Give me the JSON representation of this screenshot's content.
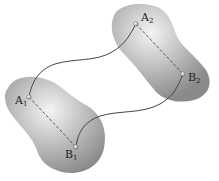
{
  "diagram": {
    "bodies": [
      {
        "id": "body-1",
        "position": "lower-left"
      },
      {
        "id": "body-2",
        "position": "upper-right"
      }
    ],
    "points": [
      {
        "id": "A1",
        "base": "A",
        "sub": "1",
        "x": 29,
        "y": 97
      },
      {
        "id": "B1",
        "base": "B",
        "sub": "1",
        "x": 76,
        "y": 147
      },
      {
        "id": "A2",
        "base": "A",
        "sub": "2",
        "x": 136,
        "y": 24
      },
      {
        "id": "B2",
        "base": "B",
        "sub": "2",
        "x": 183,
        "y": 74
      }
    ],
    "colors": {
      "body_fill": "#9a9a9a",
      "body_highlight": "#f2f2f2",
      "path_stroke": "#444444",
      "dashed_line": "#333333"
    }
  }
}
